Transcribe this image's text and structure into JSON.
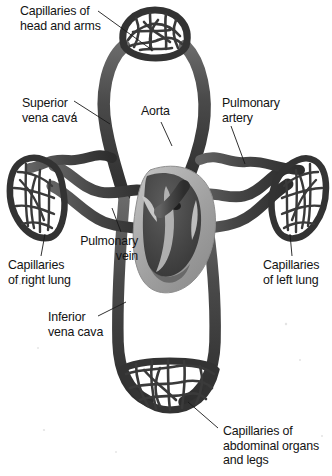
{
  "figure": {
    "type": "anatomical-diagram",
    "background_color": "#ffffff",
    "ink_color": "#2b2b2b",
    "vessel_dark_color": "#3a3a3a",
    "vessel_mid_color": "#545454",
    "heart_fill_color": "#a8a8a8",
    "heart_chamber_color": "#4a4a4a",
    "leader_line_color": "#1c1c1c"
  },
  "labels": {
    "head_and_arms": "Capillaries of\nhead and arms",
    "superior_vena_cava": "Superior\nvena cava",
    "aorta": "Aorta",
    "pulmonary_artery": "Pulmonary\nartery",
    "pulmonary_vein": "Pulmonary\nvein",
    "capillaries_right_lung": "Capillaries\nof right lung",
    "capillaries_left_lung": "Capillaries\nof left lung",
    "inferior_vena_cava": "Inferior\nvena cava",
    "capillaries_abdominal": "Capillaries of\nabdominal organs\nand legs"
  },
  "structures": [
    {
      "name": "capillary-bed-head-arms",
      "region": "top"
    },
    {
      "name": "capillary-bed-right-lung",
      "region": "left"
    },
    {
      "name": "capillary-bed-left-lung",
      "region": "right"
    },
    {
      "name": "capillary-bed-abdominal",
      "region": "bottom"
    },
    {
      "name": "heart",
      "region": "center"
    },
    {
      "name": "aorta-vessel",
      "region": "center"
    },
    {
      "name": "pulmonary-artery-vessel",
      "region": "center-right"
    },
    {
      "name": "pulmonary-vein-vessel",
      "region": "center-left"
    },
    {
      "name": "superior-vena-cava-vessel",
      "region": "upper-left"
    },
    {
      "name": "inferior-vena-cava-vessel",
      "region": "lower-left"
    }
  ]
}
